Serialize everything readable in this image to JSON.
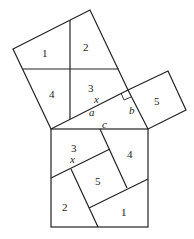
{
  "diagram": {
    "type": "pythagorean-dissection",
    "medium_square": {
      "pieces": [
        "1",
        "2",
        "3",
        "4"
      ]
    },
    "small_square": {
      "pieces": [
        "5"
      ]
    },
    "large_square": {
      "pieces": [
        "3",
        "4",
        "5",
        "2",
        "1"
      ]
    },
    "labels": {
      "p1_top": "1",
      "p2_top": "2",
      "p3_top": "3",
      "p4_top": "4",
      "x_top": "x",
      "a": "a",
      "b": "b",
      "p5_small": "5",
      "c": "c",
      "p3_big": "3",
      "x_big": "x",
      "p4_big": "4",
      "p5_big": "5",
      "p2_big": "2",
      "p1_big": "1"
    },
    "colors": {
      "stroke": "#222222",
      "background": "#ffffff"
    }
  }
}
